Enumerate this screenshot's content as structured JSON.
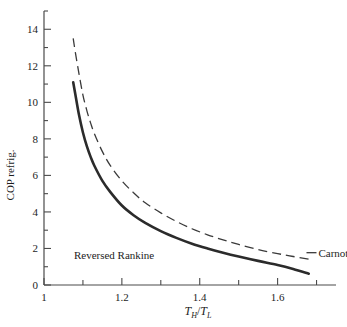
{
  "chart_data": {
    "type": "line",
    "title": "",
    "xlabel": "T_H/T_L",
    "xlabel_parts": {
      "num_base": "T",
      "num_sub": "H",
      "slash": "/",
      "den_base": "T",
      "den_sub": "L"
    },
    "ylabel": "COP refrig.",
    "xlim": [
      1.0,
      1.75
    ],
    "ylim": [
      0,
      15
    ],
    "x_ticks_major": [
      1.0,
      1.2,
      1.4,
      1.6
    ],
    "x_tick_labels": [
      "1",
      "1.2",
      "1.4",
      "1.6"
    ],
    "x_ticks_minor": [
      1.1,
      1.3,
      1.5,
      1.7
    ],
    "y_ticks_major": [
      0,
      2,
      4,
      6,
      8,
      10,
      12,
      14
    ],
    "y_tick_labels": [
      "0",
      "2",
      "4",
      "6",
      "8",
      "10",
      "12",
      "14"
    ],
    "y_ticks_minor": [
      1,
      3,
      5,
      7,
      9,
      11,
      13,
      15
    ],
    "grid": false,
    "legend_position": "inline-annotations",
    "series": [
      {
        "name": "Reversed Rankine",
        "style": "solid",
        "color": "#2b2b2b",
        "label_x": 1.18,
        "label_y": 1.45,
        "x": [
          1.075,
          1.08,
          1.09,
          1.1,
          1.11,
          1.12,
          1.13,
          1.15,
          1.17,
          1.2,
          1.23,
          1.26,
          1.3,
          1.34,
          1.38,
          1.42,
          1.46,
          1.5,
          1.55,
          1.6,
          1.64,
          1.68
        ],
        "y": [
          11.1,
          10.5,
          9.3,
          8.35,
          7.6,
          7.0,
          6.5,
          5.7,
          5.1,
          4.35,
          3.82,
          3.4,
          2.95,
          2.58,
          2.26,
          2.0,
          1.77,
          1.56,
          1.32,
          1.1,
          0.88,
          0.62
        ]
      },
      {
        "name": "Carnot",
        "style": "dashed",
        "color": "#3a3a3a",
        "label_x": 1.705,
        "label_y": 1.55,
        "x": [
          1.075,
          1.08,
          1.09,
          1.1,
          1.11,
          1.12,
          1.13,
          1.15,
          1.17,
          1.2,
          1.23,
          1.26,
          1.3,
          1.34,
          1.38,
          1.42,
          1.46,
          1.5,
          1.55,
          1.6,
          1.64,
          1.68
        ],
        "y": [
          13.5,
          12.8,
          11.55,
          10.4,
          9.55,
          8.85,
          8.25,
          7.3,
          6.55,
          5.7,
          5.05,
          4.5,
          3.95,
          3.48,
          3.08,
          2.75,
          2.47,
          2.22,
          1.94,
          1.72,
          1.56,
          1.42
        ]
      }
    ]
  }
}
